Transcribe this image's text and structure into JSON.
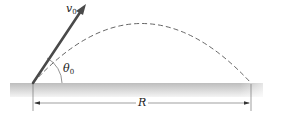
{
  "diagram": {
    "type": "projectile-motion",
    "labels": {
      "velocity": "v",
      "velocity_sub": "0",
      "angle": "θ",
      "angle_sub": "0",
      "range": "R"
    },
    "elements": [
      "ground",
      "initial-velocity-arrow",
      "dashed-trajectory",
      "launch-angle-arc",
      "range-dimension-line"
    ],
    "colors": {
      "ground_top": "#c4c4c4",
      "ground_bottom": "#f2f2f2",
      "arrow": "#4a4a4a",
      "trajectory": "#555555",
      "lines": "#666666"
    }
  }
}
